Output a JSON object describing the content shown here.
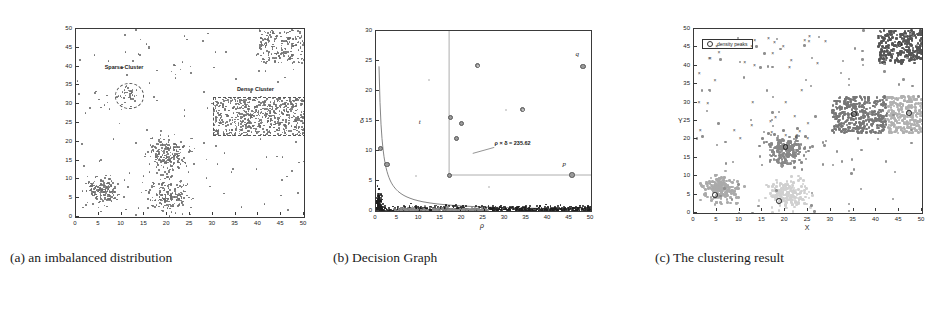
{
  "figure": {
    "panels": [
      {
        "id": "a",
        "caption": "(a) an imbalanced distribution",
        "annotations": [
          {
            "name": "sparse-cluster-label",
            "text": "Sparse Cluster"
          },
          {
            "name": "dense-cluster-label",
            "text": "Dense Cluster"
          }
        ]
      },
      {
        "id": "b",
        "caption": "(b) Decision Graph",
        "annotations": [
          {
            "name": "threshold-formula",
            "text": "ρ × δ = 235.62"
          },
          {
            "name": "point-label-q",
            "text": "q"
          },
          {
            "name": "point-label-p",
            "text": "p"
          },
          {
            "name": "point-label-t",
            "text": "t"
          }
        ]
      },
      {
        "id": "c",
        "caption": "(c) The clustering result",
        "legend": {
          "label": "density peaks",
          "marker": "circle-marker"
        }
      }
    ]
  },
  "chart_data": [
    {
      "type": "scatter",
      "panel": "a",
      "title": "an imbalanced distribution",
      "xlabel": "",
      "ylabel": "",
      "xlim": [
        0,
        50
      ],
      "ylim": [
        0,
        50
      ],
      "xticks": [
        0,
        5,
        10,
        15,
        20,
        25,
        30,
        35,
        40,
        45,
        50
      ],
      "yticks": [
        0,
        5,
        10,
        15,
        20,
        25,
        30,
        35,
        40,
        45,
        50
      ],
      "grid": false,
      "legend": "none",
      "marker_color": "#6d6d6d",
      "annotations": [
        {
          "text": "Sparse Cluster",
          "x": 11,
          "y": 39.5,
          "shape": "dashed-ellipse",
          "cx": 11.5,
          "cy": 32.5,
          "rx": 3.0,
          "ry": 3.2
        },
        {
          "text": "Dense Cluster",
          "x": 40,
          "y": 33.5,
          "shape": "dashed-rect",
          "x0": 30,
          "y0": 22,
          "x1": 50,
          "y1": 32
        }
      ],
      "clusters": [
        {
          "name": "sparse-cluster",
          "cx": 11.5,
          "cy": 32.5,
          "rx": 2.6,
          "ry": 2.6,
          "n": 34,
          "density": "low"
        },
        {
          "name": "dense-cluster",
          "x0": 30,
          "y0": 22,
          "x1": 50,
          "y1": 32,
          "n": 620,
          "density": "high"
        },
        {
          "name": "top-right-cluster",
          "x0": 40,
          "y0": 41,
          "x1": 50,
          "y1": 50,
          "n": 180,
          "density": "high"
        },
        {
          "name": "middle-cluster",
          "cx": 20,
          "cy": 17,
          "rx": 5,
          "ry": 5,
          "n": 200,
          "density": "medium"
        },
        {
          "name": "lower-left-cluster",
          "cx": 5.5,
          "cy": 7,
          "rx": 4,
          "ry": 4,
          "n": 170,
          "density": "medium"
        },
        {
          "name": "lower-middle-cluster",
          "cx": 20,
          "cy": 6,
          "rx": 5,
          "ry": 5,
          "n": 180,
          "density": "medium"
        },
        {
          "name": "background-noise",
          "x0": 0,
          "y0": 0,
          "x1": 50,
          "y1": 50,
          "n": 150,
          "density": "sparse"
        }
      ]
    },
    {
      "type": "scatter",
      "panel": "b",
      "title": "Decision Graph",
      "xlabel": "ρ",
      "ylabel": "δ",
      "xlim": [
        0,
        50
      ],
      "ylim": [
        0,
        30
      ],
      "xticks": [
        0,
        5,
        10,
        15,
        20,
        25,
        30,
        35,
        40,
        45,
        50
      ],
      "yticks": [
        0,
        5,
        10,
        15,
        20,
        25,
        30
      ],
      "grid": false,
      "legend": "none",
      "threshold_curve": {
        "equation": "ρ × δ = 235.62",
        "constant": 235.62
      },
      "guide_lines": [
        {
          "name": "vertical-threshold",
          "x": 17,
          "from_y": 6,
          "to_y": 30
        },
        {
          "name": "horizontal-threshold",
          "y": 6,
          "from_x": 17,
          "to_x": 50
        }
      ],
      "labeled_points": [
        {
          "label": "q",
          "x": 48,
          "y": 24.2
        },
        {
          "label": "p",
          "x": 45.5,
          "y": 6.1
        },
        {
          "label": "t",
          "x": 11.5,
          "y": 13.5
        }
      ],
      "peak_points": [
        {
          "x": 17.2,
          "y": 15.7
        },
        {
          "x": 19.8,
          "y": 14.7
        },
        {
          "x": 18.6,
          "y": 12.2
        },
        {
          "x": 23.5,
          "y": 24.3
        },
        {
          "x": 48.0,
          "y": 24.2
        },
        {
          "x": 45.5,
          "y": 6.1
        },
        {
          "x": 17.0,
          "y": 6.0
        },
        {
          "x": 34.0,
          "y": 17.0
        },
        {
          "x": 1.0,
          "y": 10.5
        },
        {
          "x": 2.4,
          "y": 7.8
        }
      ]
    },
    {
      "type": "scatter",
      "panel": "c",
      "title": "The clustering result",
      "xlabel": "X",
      "ylabel": "Y",
      "xlim": [
        0,
        50
      ],
      "ylim": [
        0,
        50
      ],
      "xticks": [
        0,
        5,
        10,
        15,
        20,
        25,
        30,
        35,
        40,
        45,
        50
      ],
      "yticks": [
        0,
        5,
        10,
        15,
        20,
        25,
        30,
        35,
        40,
        45,
        50
      ],
      "grid": false,
      "legend": {
        "position": "upper-left",
        "entries": [
          "density peaks"
        ]
      },
      "clusters": [
        {
          "name": "cluster-top-right",
          "color": "#555555",
          "x0": 40,
          "y0": 41,
          "x1": 50,
          "y1": 50,
          "n": 260,
          "peak": {
            "x": 45,
            "y": 46
          }
        },
        {
          "name": "cluster-dense-band-left",
          "color": "#777777",
          "x0": 30,
          "y0": 22,
          "x1": 42,
          "y1": 32,
          "n": 330,
          "peak": {
            "x": 35,
            "y": 27
          }
        },
        {
          "name": "cluster-dense-band-right",
          "color": "#b0b0b0",
          "x0": 42,
          "y0": 22,
          "x1": 50,
          "y1": 32,
          "n": 250,
          "peak": {
            "x": 47,
            "y": 27.3
          }
        },
        {
          "name": "cluster-middle",
          "color": "#888888",
          "cx": 20,
          "cy": 17.5,
          "rx": 5,
          "ry": 4.5,
          "n": 210,
          "peak": {
            "x": 20,
            "y": 18
          }
        },
        {
          "name": "cluster-lower-left",
          "color": "#aaaaaa",
          "cx": 5.5,
          "cy": 7,
          "rx": 4.2,
          "ry": 3.8,
          "n": 200,
          "peak": {
            "x": 4.5,
            "y": 5
          }
        },
        {
          "name": "cluster-lower-middle",
          "color": "#d0d0d0",
          "cx": 20,
          "cy": 5.5,
          "rx": 5,
          "ry": 4.5,
          "n": 200,
          "peak": {
            "x": 18.6,
            "y": 3.4
          }
        },
        {
          "name": "cluster-sparse-x-markers",
          "color": "#444444",
          "marker": "x",
          "n": 40
        }
      ]
    }
  ]
}
